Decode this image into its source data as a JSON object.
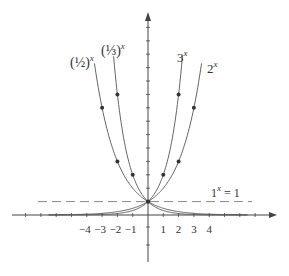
{
  "chart_data": {
    "type": "line",
    "title": "",
    "xlabel": "",
    "ylabel": "",
    "x_ticks": [
      -4,
      -3,
      -2,
      -1,
      1,
      2,
      3,
      4
    ],
    "x_tick_labels": [
      "−4",
      "−3",
      "−2",
      "−1",
      "1",
      "2",
      "3",
      "4"
    ],
    "xlim": [
      -7,
      8.5
    ],
    "ylim": [
      -4,
      15
    ],
    "grid": false,
    "legend": "inline labels",
    "series": [
      {
        "name": "(1/2)^x",
        "label_base": "(½)",
        "label_exp": "x",
        "base": 0.5,
        "points": [
          [
            -3,
            8
          ],
          [
            -2,
            4
          ]
        ],
        "x_range": [
          -3.5,
          6.5
        ]
      },
      {
        "name": "(1/3)^x",
        "label_base": "(⅓)",
        "label_exp": "x",
        "base": 0.3333,
        "points": [
          [
            -2,
            9
          ],
          [
            -1,
            3
          ]
        ],
        "x_range": [
          -2.25,
          6.5
        ]
      },
      {
        "name": "3^x",
        "label_base": "3",
        "label_exp": "x",
        "base": 3,
        "points": [
          [
            1,
            3
          ],
          [
            2,
            9
          ]
        ],
        "x_range": [
          -6.5,
          2.25
        ]
      },
      {
        "name": "2^x",
        "label_base": "2",
        "label_exp": "x",
        "base": 2,
        "points": [
          [
            2,
            4
          ],
          [
            3,
            8
          ]
        ],
        "x_range": [
          -6.5,
          3.5
        ]
      }
    ],
    "reference_line": {
      "name": "1^x = 1",
      "label_base": "1",
      "label_exp": "x",
      "label_rest": " = 1",
      "y": 1,
      "style": "dashed"
    },
    "common_point": [
      0,
      1
    ]
  },
  "colors": {
    "axis": "#444444",
    "curve": "#555555",
    "dot": "#333333",
    "dashed": "#888888"
  }
}
